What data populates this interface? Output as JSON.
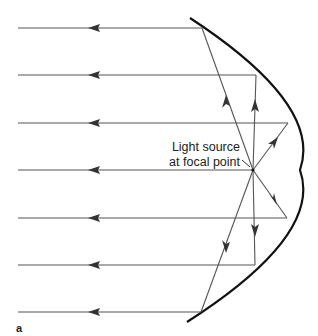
{
  "diagram": {
    "type": "parabolic reflector ray diagram",
    "label": {
      "line1": "Light source",
      "line2": "at focal point"
    },
    "caption": "a",
    "focal_point": {
      "x": 253,
      "y": 170
    },
    "rays": [
      {
        "y": 28,
        "hit_x": 202
      },
      {
        "y": 75,
        "hit_x": 256
      },
      {
        "y": 123,
        "hit_x": 288
      },
      {
        "y": 170,
        "hit_x": 300
      },
      {
        "y": 218,
        "hit_x": 287
      },
      {
        "y": 265,
        "hit_x": 255
      },
      {
        "y": 312,
        "hit_x": 201
      }
    ],
    "colors": {
      "reflector": "#111111",
      "rays": "#555555",
      "arrow": "#333333"
    }
  }
}
